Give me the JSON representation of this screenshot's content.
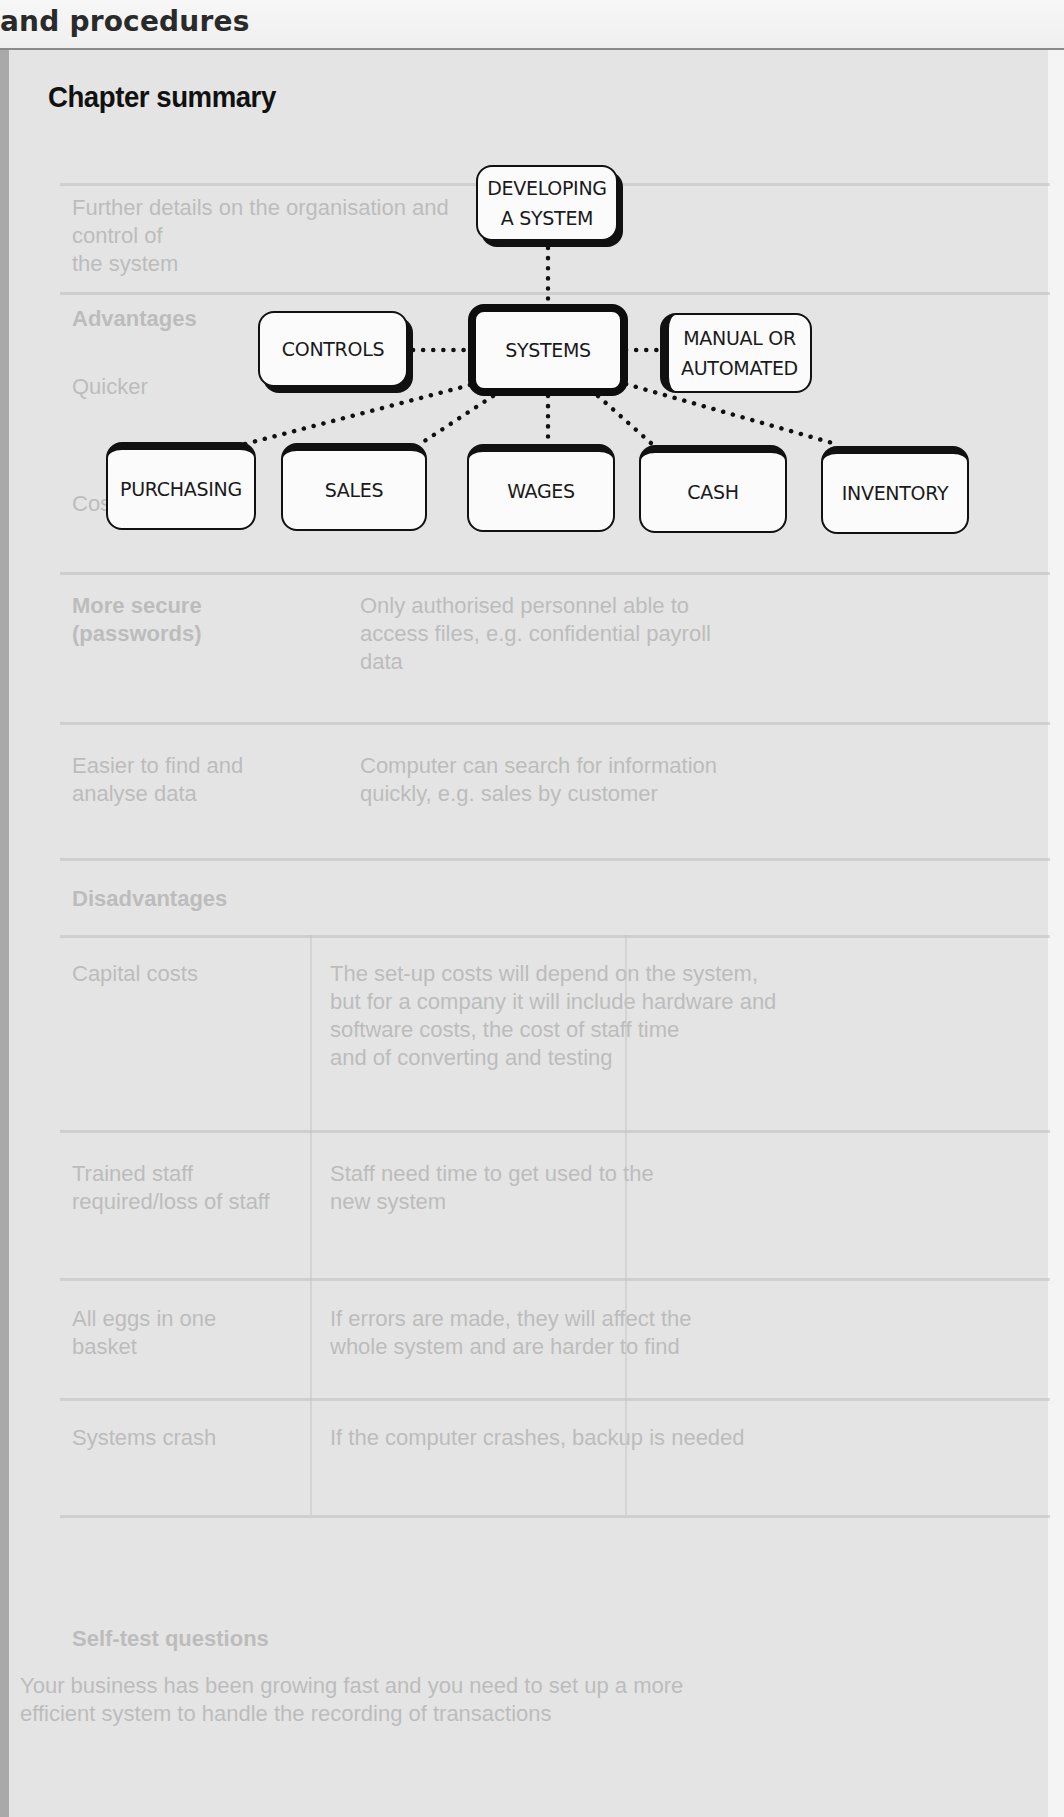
{
  "page": {
    "running_head": "and procedures",
    "section_title": "Chapter summary"
  },
  "diagram": {
    "nodes": {
      "developing": {
        "line1": "DEVELOPING",
        "line2": "A SYSTEM"
      },
      "controls": {
        "label": "CONTROLS"
      },
      "systems": {
        "label": "SYSTEMS"
      },
      "manual": {
        "line1": "MANUAL OR",
        "line2": "AUTOMATED"
      },
      "purchasing": {
        "label": "PURCHASING"
      },
      "sales": {
        "label": "SALES"
      },
      "wages": {
        "label": "WAGES"
      },
      "cash": {
        "label": "CASH"
      },
      "inventory": {
        "label": "INVENTORY"
      }
    },
    "edges": [
      {
        "from": "developing",
        "to": "systems",
        "style": "dotted"
      },
      {
        "from": "controls",
        "to": "systems",
        "style": "dotted"
      },
      {
        "from": "systems",
        "to": "manual",
        "style": "dotted"
      },
      {
        "from": "systems",
        "to": "purchasing",
        "style": "dotted"
      },
      {
        "from": "systems",
        "to": "sales",
        "style": "dotted"
      },
      {
        "from": "systems",
        "to": "wages",
        "style": "dotted"
      },
      {
        "from": "systems",
        "to": "cash",
        "style": "dotted"
      },
      {
        "from": "systems",
        "to": "inventory",
        "style": "dotted"
      }
    ]
  },
  "show_through": {
    "rows": [
      {
        "left": "",
        "right": "Further details on the organisation and control of\nthe system"
      },
      {
        "left": "Advantages",
        "right": ""
      },
      {
        "left": "Quicker",
        "right": "Less manual handling of records, so entries\ncan be made more quickly and accurately"
      },
      {
        "left": "Cost savings",
        "right": "Staff time saved"
      },
      {
        "left": "More secure\n(passwords)",
        "right": "Only authorised personnel able to\naccess files, e.g. confidential payroll\ndata"
      },
      {
        "left": "Easier to find and\nanalyse data",
        "right": "Computer can search for information\nquickly, e.g. sales by customer"
      },
      {
        "left": "Disadvantages",
        "right": ""
      },
      {
        "left": "Capital costs",
        "right": "The set-up costs will depend on the system,\nbut for a company it will include hardware and\nsoftware costs, the cost of staff time\nand of converting and testing"
      },
      {
        "left": "Trained staff\nrequired/loss of staff",
        "right": "Staff need time to get used to the\nnew system"
      },
      {
        "left": "All eggs in one\nbasket",
        "right": "If errors are made, they will affect the\nwhole system and are harder to find"
      },
      {
        "left": "Systems crash",
        "right": "If the computer crashes, backup is needed"
      }
    ],
    "bottom_heading": "Self-test questions",
    "bottom_text": "Your business has been growing fast and you need to set up a more\nefficient system to handle the recording of transactions"
  }
}
